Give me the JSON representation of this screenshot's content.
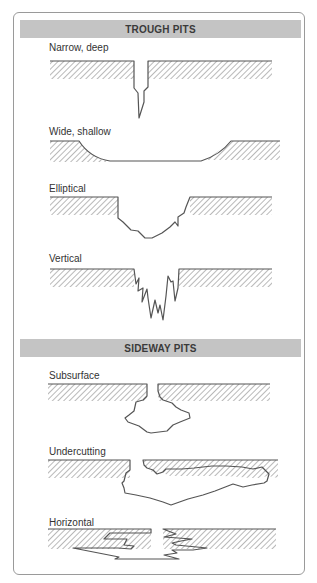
{
  "sections": [
    {
      "title": "TROUGH PITS",
      "items": [
        {
          "label": "Narrow, deep"
        },
        {
          "label": "Wide, shallow"
        },
        {
          "label": "Elliptical"
        },
        {
          "label": "Vertical"
        }
      ]
    },
    {
      "title": "SIDEWAY PITS",
      "items": [
        {
          "label": "Subsurface"
        },
        {
          "label": "Undercutting"
        },
        {
          "label": "Horizontal"
        }
      ]
    }
  ],
  "colors": {
    "header_bar": "#c4c4c4",
    "outline": "#555555",
    "frame_border": "#9a9a9a"
  }
}
